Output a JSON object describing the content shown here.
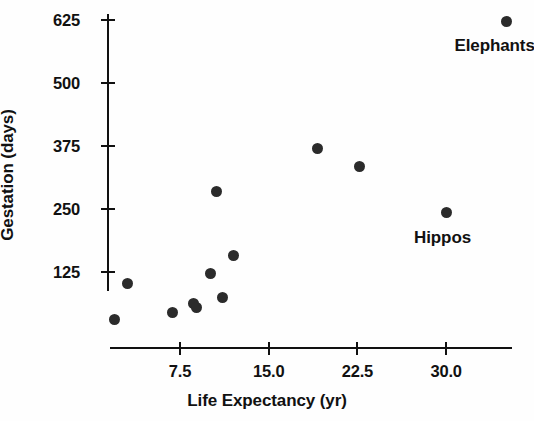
{
  "chart_data": {
    "type": "scatter",
    "title": "",
    "xlabel": "Life Expectancy (yr)",
    "ylabel": "Gestation (days)",
    "xlim": [
      0,
      36.5
    ],
    "ylim": [
      0,
      660
    ],
    "grid": false,
    "legend": "none",
    "xticks": [
      7.5,
      15.0,
      22.5,
      30.0
    ],
    "xtick_labels": [
      "7.5",
      "15.0",
      "22.5",
      "30.0"
    ],
    "yticks": [
      125,
      250,
      375,
      500,
      625
    ],
    "ytick_labels": [
      "125",
      "250",
      "375",
      "500",
      "625"
    ],
    "marker": "filled-circle",
    "marker_color": "#2b2b2b",
    "points": [
      {
        "x": 2.0,
        "y": 30,
        "label": ""
      },
      {
        "x": 3.1,
        "y": 103,
        "label": ""
      },
      {
        "x": 6.9,
        "y": 44,
        "label": ""
      },
      {
        "x": 8.6,
        "y": 63,
        "label": ""
      },
      {
        "x": 8.9,
        "y": 54,
        "label": ""
      },
      {
        "x": 10.1,
        "y": 123,
        "label": ""
      },
      {
        "x": 10.6,
        "y": 284,
        "label": ""
      },
      {
        "x": 11.1,
        "y": 75,
        "label": ""
      },
      {
        "x": 12.0,
        "y": 157,
        "label": ""
      },
      {
        "x": 19.1,
        "y": 371,
        "label": ""
      },
      {
        "x": 22.7,
        "y": 335,
        "label": ""
      },
      {
        "x": 30.0,
        "y": 244,
        "label": "Hippos"
      },
      {
        "x": 35.1,
        "y": 623,
        "label": "Elephants"
      }
    ],
    "annotations": [
      {
        "text": "Elephants",
        "x": 34.1,
        "y": 573
      },
      {
        "text": "Hippos",
        "x": 29.7,
        "y": 192
      }
    ]
  }
}
